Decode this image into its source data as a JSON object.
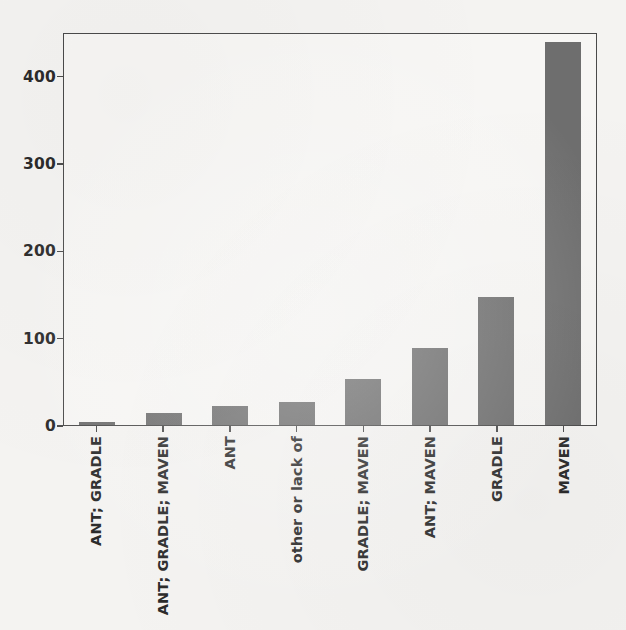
{
  "chart_data": {
    "type": "bar",
    "title": "",
    "subtitle": "",
    "xlabel": "",
    "ylabel": "",
    "categories": [
      "ANT; GRADLE",
      "ANT; GRADLE; MAVEN",
      "ANT",
      "other or lack of",
      "GRADLE; MAVEN",
      "ANT; MAVEN",
      "GRADLE",
      "MAVEN"
    ],
    "values": [
      4,
      14,
      22,
      26,
      53,
      88,
      147,
      438
    ],
    "ylim": [
      0,
      450
    ],
    "yticks": [
      0,
      100,
      200,
      300,
      400
    ],
    "ytick_labels": [
      "0",
      "100",
      "200",
      "300",
      "400"
    ],
    "grid": false,
    "legend": false,
    "legend_position": "none",
    "orientation": "vertical",
    "bar_color": "#6e6e6e",
    "axis_color": "#4a4a4a",
    "background_color": "#f4f3f1",
    "plot_background_color": "#f7f6f4",
    "tick_label_color": "#2b2b2b",
    "xtick_label_rotation": "90"
  }
}
